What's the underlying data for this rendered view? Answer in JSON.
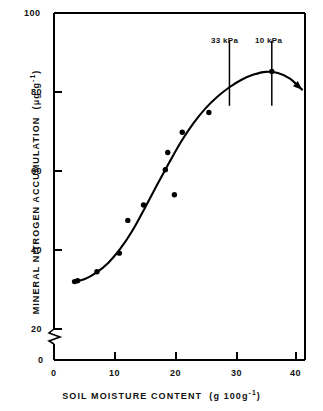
{
  "chart_data": {
    "type": "scatter",
    "title": "",
    "xlabel": "SOIL MOISTURE CONTENT  (g 100g⁻¹)",
    "xlabel_main": "SOIL MOISTURE CONTENT",
    "xlabel_units_open": "(g 100g",
    "xlabel_units_sup": "-1",
    "xlabel_units_close": ")",
    "ylabel": "MINERAL NITROGEN ACCUMULATION  (μg g⁻¹)",
    "ylabel_main": "MINERAL NITROGEN ACCUMULATION",
    "ylabel_units_open": "(μg g",
    "ylabel_units_sup": "-1",
    "ylabel_units_close": ")",
    "xlim": [
      0,
      43
    ],
    "ylim": [
      0,
      100
    ],
    "y_axis_break": {
      "between": [
        0,
        20
      ],
      "present": true
    },
    "xticks": [
      0,
      10,
      20,
      30,
      40
    ],
    "xtick_labels": [
      "0",
      "10",
      "20",
      "30",
      "40"
    ],
    "yticks": [
      0,
      20,
      40,
      60,
      80,
      100
    ],
    "ytick_labels": [
      "0",
      "20",
      "40",
      "60",
      "80",
      "100"
    ],
    "grid": false,
    "legend": "none",
    "series": [
      {
        "name": "Mineral nitrogen accumulation",
        "marker": "filled-circle",
        "points": [
          {
            "x": 3.4,
            "y": 32.0
          },
          {
            "x": 3.9,
            "y": 32.2
          },
          {
            "x": 7.1,
            "y": 34.5
          },
          {
            "x": 10.8,
            "y": 39.2
          },
          {
            "x": 12.2,
            "y": 47.5
          },
          {
            "x": 14.8,
            "y": 51.4
          },
          {
            "x": 18.4,
            "y": 60.3
          },
          {
            "x": 18.8,
            "y": 64.7
          },
          {
            "x": 19.9,
            "y": 54.0
          },
          {
            "x": 21.2,
            "y": 69.8
          },
          {
            "x": 25.6,
            "y": 74.8
          },
          {
            "x": 36.0,
            "y": 85.2
          }
        ]
      }
    ],
    "fitted_curve": {
      "name": "fitted response curve",
      "style": "solid",
      "arrow_end": true,
      "points": [
        {
          "x": 3.4,
          "y": 32.0
        },
        {
          "x": 5.0,
          "y": 32.6
        },
        {
          "x": 7.0,
          "y": 34.3
        },
        {
          "x": 9.0,
          "y": 36.8
        },
        {
          "x": 11.0,
          "y": 40.4
        },
        {
          "x": 13.0,
          "y": 45.0
        },
        {
          "x": 15.0,
          "y": 50.6
        },
        {
          "x": 17.0,
          "y": 56.4
        },
        {
          "x": 19.0,
          "y": 62.0
        },
        {
          "x": 21.0,
          "y": 67.4
        },
        {
          "x": 23.0,
          "y": 72.0
        },
        {
          "x": 25.0,
          "y": 75.8
        },
        {
          "x": 27.0,
          "y": 78.8
        },
        {
          "x": 29.0,
          "y": 81.2
        },
        {
          "x": 31.0,
          "y": 83.1
        },
        {
          "x": 33.0,
          "y": 84.4
        },
        {
          "x": 35.0,
          "y": 85.1
        },
        {
          "x": 37.0,
          "y": 84.8
        },
        {
          "x": 39.0,
          "y": 83.4
        },
        {
          "x": 41.0,
          "y": 80.6
        }
      ]
    },
    "annotations": [
      {
        "label": "33 kPa",
        "x": 29.0,
        "y_top": 93.0,
        "y_bottom": 76.5,
        "type": "vertical-reference-line"
      },
      {
        "label": "10 kPa",
        "x": 36.0,
        "y_top": 93.0,
        "y_bottom": 76.5,
        "type": "vertical-reference-line"
      }
    ]
  }
}
